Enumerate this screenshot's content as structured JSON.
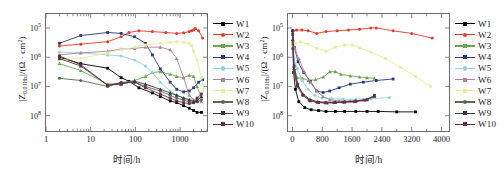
{
  "figure": {
    "panels": [
      "left",
      "right"
    ]
  },
  "axis": {
    "ylabel_prefix": "|Z",
    "ylabel_sub": "0.01Hz",
    "ylabel_suffix": "|/(Ω · cm",
    "ylabel_sup": "2",
    "ylabel_close": ")",
    "xlabel": "时间/h",
    "yticks": [
      "10",
      "10",
      "10",
      "10"
    ],
    "ytick_exps": [
      "8",
      "7",
      "6",
      "5"
    ],
    "xticks_left": [
      "1",
      "10",
      "100",
      "1000"
    ],
    "xticks_right": [
      "0",
      "800",
      "1600",
      "2400",
      "3200",
      "4000"
    ]
  },
  "legend": {
    "entries": [
      {
        "label": "W1",
        "color": "#000000"
      },
      {
        "label": "W2",
        "color": "#e8392b"
      },
      {
        "label": "W3",
        "color": "#6aa84f"
      },
      {
        "label": "W4",
        "color": "#2b3a7a"
      },
      {
        "label": "W5",
        "color": "#8fd3e0"
      },
      {
        "label": "W6",
        "color": "#b08296"
      },
      {
        "label": "W7",
        "color": "#e3ef9a"
      },
      {
        "label": "W8",
        "color": "#5a6b52"
      },
      {
        "label": "W9",
        "color": "#3a3a3a"
      },
      {
        "label": "W10",
        "color": "#6b2c4a"
      }
    ]
  },
  "chart_data": [
    {
      "id": "left",
      "type": "line",
      "title": "",
      "xlabel": "时间/h",
      "ylabel": "|Z0.01Hz|/(Ω · cm2)",
      "xscale": "log",
      "yscale": "log",
      "xlim": [
        1,
        4000
      ],
      "ylim": [
        30000,
        300000000
      ],
      "xticks": [
        1,
        10,
        100,
        1000
      ],
      "yticks": [
        100000,
        1000000,
        10000000,
        100000000
      ],
      "grid": false,
      "legend_position": "right-outside",
      "series": [
        {
          "name": "W1",
          "color": "#000000",
          "x": [
            2,
            6,
            24,
            48,
            72,
            120,
            240,
            360,
            600,
            840,
            1200,
            1600,
            2000,
            2400,
            3000
          ],
          "y": [
            10000000.0,
            6000000.0,
            4200000.0,
            2000000.0,
            1500000.0,
            900000.0,
            600000.0,
            450000.0,
            320000.0,
            280000.0,
            220000.0,
            180000.0,
            150000.0,
            130000.0,
            130000.0
          ]
        },
        {
          "name": "W2",
          "color": "#e8392b",
          "x": [
            2,
            6,
            24,
            48,
            72,
            120,
            240,
            480,
            840,
            1200,
            1600,
            1800,
            2000,
            2200,
            2600,
            3200
          ],
          "y": [
            24000000.0,
            28000000.0,
            34000000.0,
            50000000.0,
            70000000.0,
            80000000.0,
            75000000.0,
            70000000.0,
            65000000.0,
            68000000.0,
            75000000.0,
            80000000.0,
            85000000.0,
            95000000.0,
            80000000.0,
            45000000.0
          ]
        },
        {
          "name": "W3",
          "color": "#6aa84f",
          "x": [
            2,
            6,
            24,
            48,
            96,
            168,
            240,
            360,
            600,
            840,
            1200,
            1600,
            2000,
            2400,
            3000
          ],
          "y": [
            6000000.0,
            3500000.0,
            1200000.0,
            1300000.0,
            1600000.0,
            2200000.0,
            3000000.0,
            3200000.0,
            2600000.0,
            2200000.0,
            2000000.0,
            2400000.0,
            2200000.0,
            1000000.0,
            400000.0
          ]
        },
        {
          "name": "W4",
          "color": "#2b3a7a",
          "x": [
            2,
            6,
            24,
            48,
            96,
            168,
            240,
            360,
            600,
            840,
            1200,
            1600,
            2000,
            2600,
            3200
          ],
          "y": [
            30000000.0,
            55000000.0,
            70000000.0,
            65000000.0,
            50000000.0,
            30000000.0,
            12000000.0,
            4000000.0,
            1400000.0,
            800000.0,
            650000.0,
            700000.0,
            900000.0,
            1400000.0,
            1700000.0
          ]
        },
        {
          "name": "W5",
          "color": "#8fd3e0",
          "x": [
            2,
            6,
            24,
            48,
            96,
            168,
            240,
            360,
            600,
            840,
            1200,
            1800,
            2400,
            3000
          ],
          "y": [
            15000000.0,
            14000000.0,
            12000000.0,
            11000000.0,
            8000000.0,
            5000000.0,
            3000000.0,
            1400000.0,
            700000.0,
            500000.0,
            400000.0,
            360000.0,
            360000.0,
            400000.0
          ]
        },
        {
          "name": "W6",
          "color": "#b08296",
          "x": [
            2,
            6,
            24,
            48,
            96,
            168,
            360,
            600,
            840,
            1200,
            1600,
            2000,
            2400,
            3000
          ],
          "y": [
            12000000.0,
            14000000.0,
            16000000.0,
            19000000.0,
            20000000.0,
            22000000.0,
            22000000.0,
            18000000.0,
            9000000.0,
            2000000.0,
            500000.0,
            350000.0,
            320000.0,
            300000.0
          ]
        },
        {
          "name": "W7",
          "color": "#e3ef9a",
          "x": [
            2,
            6,
            24,
            48,
            96,
            168,
            360,
            600,
            840,
            1200,
            1600,
            1800,
            2000,
            2400,
            3000,
            3400
          ],
          "y": [
            8000000.0,
            9000000.0,
            14000000.0,
            18000000.0,
            22000000.0,
            26000000.0,
            30000000.0,
            32000000.0,
            34000000.0,
            32000000.0,
            30000000.0,
            24000000.0,
            16000000.0,
            8000000.0,
            2000000.0,
            800000.0
          ]
        },
        {
          "name": "W8",
          "color": "#5a6b52",
          "x": [
            2,
            6,
            24,
            48,
            96,
            168,
            360,
            600,
            840,
            1200,
            1600,
            2000,
            2400,
            3000
          ],
          "y": [
            1900000.0,
            1600000.0,
            1000000.0,
            1400000.0,
            1400000.0,
            1000000.0,
            700000.0,
            500000.0,
            400000.0,
            340000.0,
            300000.0,
            280000.0,
            300000.0,
            350000.0
          ]
        },
        {
          "name": "W9",
          "color": "#3a3a3a",
          "x": [
            2,
            6,
            24,
            48,
            96,
            168,
            360,
            600,
            840,
            1200,
            1600,
            2000,
            2400,
            3000
          ],
          "y": [
            9000000.0,
            5000000.0,
            1100000.0,
            1200000.0,
            1500000.0,
            1200000.0,
            800000.0,
            600000.0,
            500000.0,
            400000.0,
            350000.0,
            300000.0,
            320000.0,
            450000.0
          ]
        },
        {
          "name": "W10",
          "color": "#6b2c4a",
          "x": [
            2,
            6,
            24,
            48,
            96,
            168,
            360,
            600,
            840,
            1200,
            1600,
            2000,
            2400,
            3000
          ],
          "y": [
            11000000.0,
            5500000.0,
            1100000.0,
            1300000.0,
            1400000.0,
            900000.0,
            550000.0,
            400000.0,
            320000.0,
            280000.0,
            260000.0,
            280000.0,
            400000.0,
            550000.0
          ]
        }
      ]
    },
    {
      "id": "right",
      "type": "line",
      "title": "",
      "xlabel": "时间/h",
      "ylabel": "|Z0.01Hz|/(Ω · cm2)",
      "xscale": "linear",
      "yscale": "log",
      "xlim": [
        -120,
        4200
      ],
      "ylim": [
        30000,
        300000000
      ],
      "xticks": [
        0,
        800,
        1600,
        2400,
        3200,
        4000
      ],
      "yticks": [
        100000,
        1000000,
        10000000,
        100000000
      ],
      "grid": false,
      "legend_position": "right-outside",
      "series": [
        {
          "name": "W1",
          "color": "#000000",
          "x": [
            5,
            30,
            80,
            170,
            330,
            500,
            700,
            900,
            1150,
            1400,
            1700,
            2000,
            2300,
            2800,
            3300
          ],
          "y": [
            80000000.0,
            3000000.0,
            800000.0,
            300000.0,
            190000.0,
            160000.0,
            150000.0,
            140000.0,
            140000.0,
            140000.0,
            140000.0,
            140000.0,
            140000.0,
            135000.0,
            135000.0
          ]
        },
        {
          "name": "W2",
          "color": "#e8392b",
          "x": [
            20,
            110,
            250,
            420,
            650,
            900,
            1200,
            1500,
            1800,
            2100,
            2250,
            2700,
            3200,
            3750
          ],
          "y": [
            80000000.0,
            85000000.0,
            85000000.0,
            80000000.0,
            65000000.0,
            75000000.0,
            80000000.0,
            85000000.0,
            90000000.0,
            100000000.0,
            100000000.0,
            80000000.0,
            65000000.0,
            45000000.0
          ]
        },
        {
          "name": "W3",
          "color": "#6aa84f",
          "x": [
            5,
            40,
            120,
            260,
            430,
            620,
            830,
            1000,
            1150,
            1300,
            1550,
            1800,
            2000,
            2200
          ],
          "y": [
            30000000.0,
            5000000.0,
            2000000.0,
            1900000.0,
            1600000.0,
            1700000.0,
            2100000.0,
            3200000.0,
            3200000.0,
            2600000.0,
            2300000.0,
            2100000.0,
            2000000.0,
            1900000.0
          ]
        },
        {
          "name": "W4",
          "color": "#2b3a7a",
          "x": [
            5,
            50,
            150,
            300,
            480,
            650,
            820,
            1000,
            1250,
            1550,
            1900,
            2250,
            2700
          ],
          "y": [
            80000000.0,
            22000000.0,
            7000000.0,
            3000000.0,
            1500000.0,
            700000.0,
            620000.0,
            700000.0,
            900000.0,
            1200000.0,
            1400000.0,
            1600000.0,
            1800000.0
          ]
        },
        {
          "name": "W5",
          "color": "#8fd3e0",
          "x": [
            5,
            40,
            130,
            260,
            420,
            600,
            800,
            1050,
            1350,
            1700,
            2100,
            2600
          ],
          "y": [
            25000000.0,
            9000000.0,
            4000000.0,
            1600000.0,
            800000.0,
            500000.0,
            400000.0,
            380000.0,
            370000.0,
            370000.0,
            380000.0,
            420000.0
          ]
        },
        {
          "name": "W6",
          "color": "#b08296",
          "x": [
            5,
            60,
            170,
            320,
            480,
            650,
            820,
            1000,
            1250,
            1550,
            1900,
            2200
          ],
          "y": [
            35000000.0,
            20000000.0,
            9000000.0,
            3200000.0,
            1400000.0,
            700000.0,
            450000.0,
            350000.0,
            320000.0,
            320000.0,
            340000.0,
            450000.0
          ]
        },
        {
          "name": "W7",
          "color": "#e3ef9a",
          "x": [
            5,
            80,
            220,
            420,
            650,
            900,
            1150,
            1400,
            1600,
            1800,
            2100,
            2500,
            2900,
            3300,
            3700
          ],
          "y": [
            20000000.0,
            30000000.0,
            33000000.0,
            28000000.0,
            20000000.0,
            16000000.0,
            22000000.0,
            26000000.0,
            26000000.0,
            21000000.0,
            15000000.0,
            9000000.0,
            4500000.0,
            2200000.0,
            1000000.0
          ]
        },
        {
          "name": "W8",
          "color": "#5a6b52",
          "x": [
            5,
            40,
            130,
            270,
            450,
            650,
            870,
            1100,
            1350,
            1650,
            1950,
            2200
          ],
          "y": [
            20000000.0,
            3000000.0,
            1000000.0,
            500000.0,
            340000.0,
            290000.0,
            280000.0,
            280000.0,
            290000.0,
            300000.0,
            340000.0,
            450000.0
          ]
        },
        {
          "name": "W9",
          "color": "#3a3a3a",
          "x": [
            5,
            40,
            130,
            280,
            470,
            680,
            900,
            1150,
            1400,
            1700,
            2000,
            2200
          ],
          "y": [
            40000000.0,
            4000000.0,
            1100000.0,
            550000.0,
            360000.0,
            300000.0,
            290000.0,
            290000.0,
            300000.0,
            320000.0,
            360000.0,
            480000.0
          ]
        },
        {
          "name": "W10",
          "color": "#6b2c4a",
          "x": [
            5,
            45,
            140,
            290,
            480,
            700,
            920,
            1150,
            1400,
            1700,
            2000,
            2200
          ],
          "y": [
            60000000.0,
            5000000.0,
            1200000.0,
            500000.0,
            320000.0,
            280000.0,
            270000.0,
            280000.0,
            290000.0,
            310000.0,
            350000.0,
            500000.0
          ]
        }
      ]
    }
  ]
}
